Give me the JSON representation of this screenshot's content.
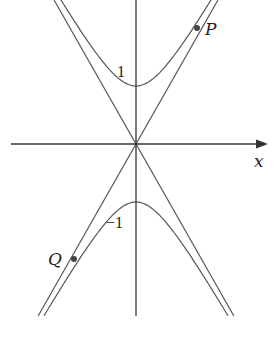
{
  "diagram": {
    "type": "hyperbola-with-asymptotes",
    "equation_form": "y^2/a^2 - x^2/b^2 = 1",
    "axis_labels": {
      "x": "x"
    },
    "tick_labels": {
      "upper_vertex": "1",
      "lower_vertex": "−1"
    },
    "points": [
      {
        "name": "P",
        "label": "P",
        "branch": "upper",
        "side": "right"
      },
      {
        "name": "Q",
        "label": "Q",
        "branch": "lower",
        "side": "left"
      }
    ],
    "colors": {
      "curve": "#555555",
      "axis": "#333333",
      "point": "#444444",
      "background": "#ffffff"
    }
  }
}
